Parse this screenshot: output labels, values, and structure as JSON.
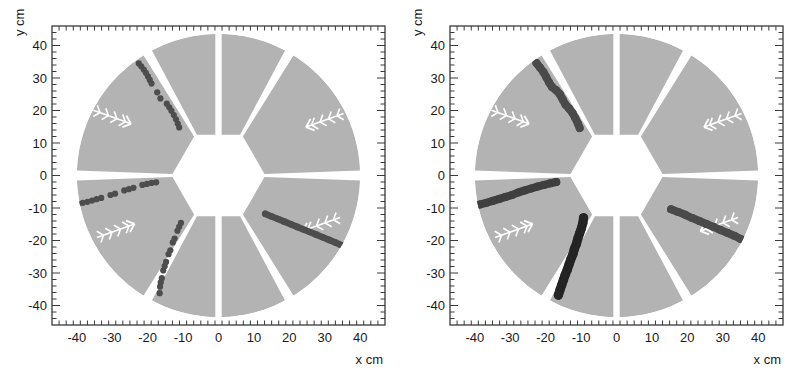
{
  "figure": {
    "kind": "detector-event-display",
    "panel_count": 2,
    "background_color": "#ffffff",
    "frame_color": "#3a3a3a",
    "sector_fill_color": "#b3b3b3",
    "hit_color_dark": "#4d4d4d",
    "hit_color_darker": "#2b2b2b",
    "marker_color": "#ffffff"
  },
  "chart_data": {
    "type": "scatter",
    "title": "",
    "subtitle": "",
    "xlabel": "x cm",
    "ylabel": "y cm",
    "xlim": [
      -47,
      47
    ],
    "ylim": [
      -46,
      46
    ],
    "grid": false,
    "legend": "none",
    "x_ticks": [
      -40,
      -30,
      -20,
      -10,
      0,
      10,
      20,
      30,
      40
    ],
    "x_tick_labels": [
      "-40",
      "-30",
      "-20",
      "-10",
      "0",
      "10",
      "20",
      "30",
      "40"
    ],
    "y_ticks": [
      40,
      30,
      20,
      10,
      0,
      -10,
      -20,
      -30,
      -40
    ],
    "y_tick_labels": [
      "40",
      "30",
      "20",
      "10",
      "0",
      "-10",
      "-20",
      "-30",
      "-40"
    ],
    "minor_ticks_per_major": 5,
    "detector": {
      "outer_radius_cm": 40,
      "inner_hexagon_radius_cm": 13,
      "sector_count": 6,
      "sector_gap_deg": 4,
      "vertical_split": true
    },
    "panels": [
      {
        "name": "event-display-left",
        "index": 0,
        "marker_chevrons": [
          {
            "x": -30,
            "y": 18,
            "angle_deg": 200
          },
          {
            "x": 30,
            "y": 17,
            "angle_deg": -20
          },
          {
            "x": -29,
            "y": -17,
            "angle_deg": 160
          },
          {
            "x": 29,
            "y": -15,
            "angle_deg": -20
          }
        ],
        "tracks": [
          {
            "name": "track-upper-left",
            "style": "segmented",
            "shade": "#4d4d4d",
            "points": [
              [
                -22.5,
                34.5
              ],
              [
                -21.8,
                33.6
              ],
              [
                -21.1,
                32.6
              ],
              [
                -20.5,
                31.6
              ],
              [
                -19.9,
                30.5
              ],
              [
                -19.4,
                29.4
              ],
              [
                -18.9,
                28.3
              ],
              [
                -17.3,
                25.6
              ],
              [
                -16.4,
                23.7
              ],
              [
                -14.6,
                22.1
              ],
              [
                -13.9,
                21.0
              ],
              [
                -13.3,
                19.9
              ],
              [
                -12.6,
                18.6
              ],
              [
                -12.0,
                17.3
              ],
              [
                -11.5,
                16.0
              ],
              [
                -11.1,
                14.8
              ]
            ]
          },
          {
            "name": "track-left-horizontal",
            "style": "segmented",
            "shade": "#4d4d4d",
            "points": [
              [
                -39.6,
                -8.7
              ],
              [
                -38.3,
                -8.4
              ],
              [
                -37.0,
                -8.1
              ],
              [
                -35.7,
                -7.7
              ],
              [
                -34.4,
                -7.3
              ],
              [
                -33.1,
                -6.9
              ],
              [
                -30.5,
                -6.0
              ],
              [
                -29.2,
                -5.6
              ],
              [
                -26.6,
                -4.6
              ],
              [
                -25.3,
                -4.2
              ],
              [
                -24.0,
                -3.8
              ],
              [
                -21.5,
                -2.9
              ],
              [
                -20.2,
                -2.6
              ],
              [
                -18.9,
                -2.3
              ],
              [
                -17.6,
                -2.1
              ]
            ]
          },
          {
            "name": "track-lower-left",
            "style": "segmented",
            "shade": "#4d4d4d",
            "points": [
              [
                -10.6,
                -14.6
              ],
              [
                -11.1,
                -15.8
              ],
              [
                -11.6,
                -17.0
              ],
              [
                -12.4,
                -19.4
              ],
              [
                -12.9,
                -20.6
              ],
              [
                -13.6,
                -23.0
              ],
              [
                -14.1,
                -24.2
              ],
              [
                -14.8,
                -26.6
              ],
              [
                -15.2,
                -27.9
              ],
              [
                -15.6,
                -29.2
              ],
              [
                -16.0,
                -31.6
              ],
              [
                -16.3,
                -32.9
              ],
              [
                -16.5,
                -34.2
              ],
              [
                -16.6,
                -36.2
              ]
            ]
          },
          {
            "name": "track-right-lower",
            "style": "solid",
            "shade": "#4d4d4d",
            "points": [
              [
                13.2,
                -11.8
              ],
              [
                15.0,
                -12.6
              ],
              [
                16.8,
                -13.4
              ],
              [
                18.6,
                -14.2
              ],
              [
                20.4,
                -15.0
              ],
              [
                22.2,
                -15.8
              ],
              [
                24.0,
                -16.6
              ],
              [
                25.8,
                -17.4
              ],
              [
                27.6,
                -18.2
              ],
              [
                29.4,
                -19.0
              ],
              [
                31.2,
                -19.8
              ],
              [
                33.0,
                -20.6
              ],
              [
                34.6,
                -21.4
              ]
            ]
          }
        ]
      },
      {
        "name": "event-display-right",
        "index": 1,
        "marker_chevrons": [
          {
            "x": -30,
            "y": 18,
            "angle_deg": 200
          },
          {
            "x": 30,
            "y": 17,
            "angle_deg": -20
          },
          {
            "x": -29,
            "y": -17,
            "angle_deg": 160
          },
          {
            "x": 29,
            "y": -15,
            "angle_deg": -20
          }
        ],
        "tracks": [
          {
            "name": "track-upper-left",
            "style": "thick",
            "shade": "#4a4a4a",
            "points": [
              [
                -22.6,
                34.6
              ],
              [
                -21.6,
                33.2
              ],
              [
                -20.6,
                31.8
              ],
              [
                -19.8,
                30.2
              ],
              [
                -19.0,
                28.6
              ],
              [
                -18.2,
                27.2
              ],
              [
                -17.0,
                26.2
              ],
              [
                -16.0,
                25.0
              ],
              [
                -15.2,
                23.4
              ],
              [
                -14.4,
                21.8
              ],
              [
                -13.4,
                20.6
              ],
              [
                -12.4,
                19.2
              ],
              [
                -11.6,
                17.6
              ],
              [
                -10.9,
                16.0
              ],
              [
                -10.4,
                14.6
              ]
            ]
          },
          {
            "name": "track-left-horizontal",
            "style": "thick",
            "shade": "#3f3f3f",
            "points": [
              [
                -40.3,
                -9.4
              ],
              [
                -38.5,
                -8.9
              ],
              [
                -36.7,
                -8.4
              ],
              [
                -34.9,
                -7.8
              ],
              [
                -33.1,
                -7.2
              ],
              [
                -31.3,
                -6.6
              ],
              [
                -29.5,
                -6.0
              ],
              [
                -27.7,
                -5.2
              ],
              [
                -25.9,
                -4.6
              ],
              [
                -24.1,
                -4.0
              ],
              [
                -22.3,
                -3.4
              ],
              [
                -20.5,
                -2.9
              ],
              [
                -18.7,
                -2.4
              ],
              [
                -17.0,
                -2.0
              ]
            ]
          },
          {
            "name": "track-lower-left",
            "style": "thick-dark",
            "shade": "#242424",
            "points": [
              [
                -9.3,
                -13.0
              ],
              [
                -9.5,
                -14.6
              ],
              [
                -9.9,
                -16.2
              ],
              [
                -10.4,
                -17.8
              ],
              [
                -10.9,
                -19.4
              ],
              [
                -11.3,
                -21.0
              ],
              [
                -11.9,
                -22.6
              ],
              [
                -12.3,
                -24.2
              ],
              [
                -12.9,
                -25.8
              ],
              [
                -13.4,
                -27.4
              ],
              [
                -13.9,
                -29.0
              ],
              [
                -14.5,
                -30.6
              ],
              [
                -15.0,
                -32.2
              ],
              [
                -15.5,
                -33.8
              ],
              [
                -16.0,
                -35.4
              ],
              [
                -16.4,
                -36.8
              ]
            ]
          },
          {
            "name": "track-right-lower",
            "style": "thick",
            "shade": "#4a4a4a",
            "points": [
              [
                15.4,
                -10.4
              ],
              [
                17.4,
                -11.2
              ],
              [
                19.4,
                -12.1
              ],
              [
                21.4,
                -13.1
              ],
              [
                23.4,
                -14.0
              ],
              [
                25.4,
                -14.9
              ],
              [
                27.4,
                -15.8
              ],
              [
                29.4,
                -16.8
              ],
              [
                31.4,
                -17.7
              ],
              [
                33.4,
                -18.6
              ],
              [
                35.2,
                -19.6
              ]
            ]
          }
        ]
      }
    ]
  }
}
